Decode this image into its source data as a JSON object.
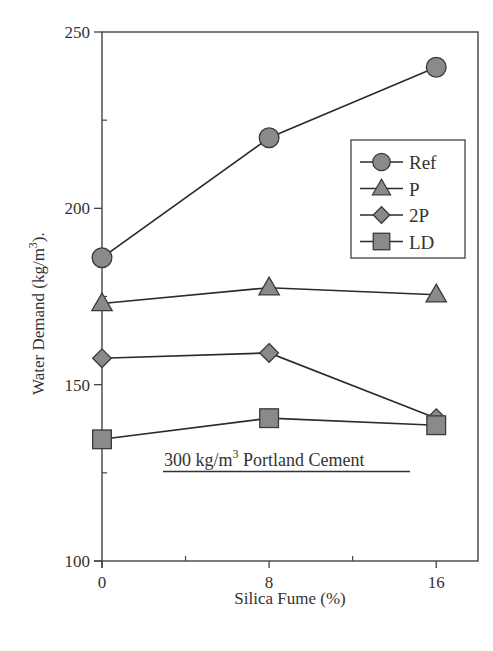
{
  "chart_data": {
    "type": "line",
    "title": "",
    "xlabel": "Silica Fume (%)",
    "ylabel": "Water Demand (kg/m3).",
    "ylabel_parts": {
      "pre": "Water Demand (kg/m",
      "sup": "3",
      "post": ")."
    },
    "x": [
      0,
      8,
      16
    ],
    "xlim": [
      0,
      18
    ],
    "ylim": [
      100,
      250
    ],
    "x_ticks": [
      0,
      8,
      16
    ],
    "x_minor_ticks": [
      4,
      12
    ],
    "y_ticks": [
      100,
      150,
      200,
      250
    ],
    "y_minor_ticks": [
      125,
      175,
      225
    ],
    "grid": false,
    "legend_position": "upper right",
    "series": [
      {
        "name": "Ref",
        "marker": "circle",
        "values": [
          186,
          220,
          240
        ]
      },
      {
        "name": "P",
        "marker": "triangle",
        "values": [
          173,
          177.5,
          175.5
        ]
      },
      {
        "name": "2P",
        "marker": "diamond",
        "values": [
          157.5,
          159,
          140.5
        ]
      },
      {
        "name": "LD",
        "marker": "square",
        "values": [
          134.5,
          140.5,
          138.5
        ]
      }
    ],
    "annotations": [
      {
        "text_pre": "300 kg/m",
        "text_sup": "3",
        "text_post": " Portland Cement",
        "underlined": true
      }
    ],
    "colors": {
      "line": "#2b2b2b",
      "marker_fill": "#8a8a8a",
      "marker_stroke": "#3a3a3a",
      "axis": "#444444"
    }
  }
}
